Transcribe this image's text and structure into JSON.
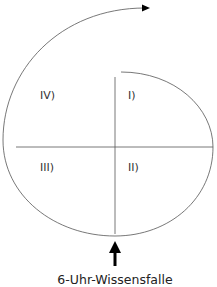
{
  "diagram": {
    "quadrants": [
      {
        "id": "I",
        "label": "I)"
      },
      {
        "id": "II",
        "label": "II)"
      },
      {
        "id": "III",
        "label": "III)"
      },
      {
        "id": "IV",
        "label": "IV)"
      }
    ],
    "caption": "6-Uhr-Wissensfalle",
    "colors": {
      "line": "#555555",
      "arrow": "#000000",
      "text": "#333333"
    }
  }
}
